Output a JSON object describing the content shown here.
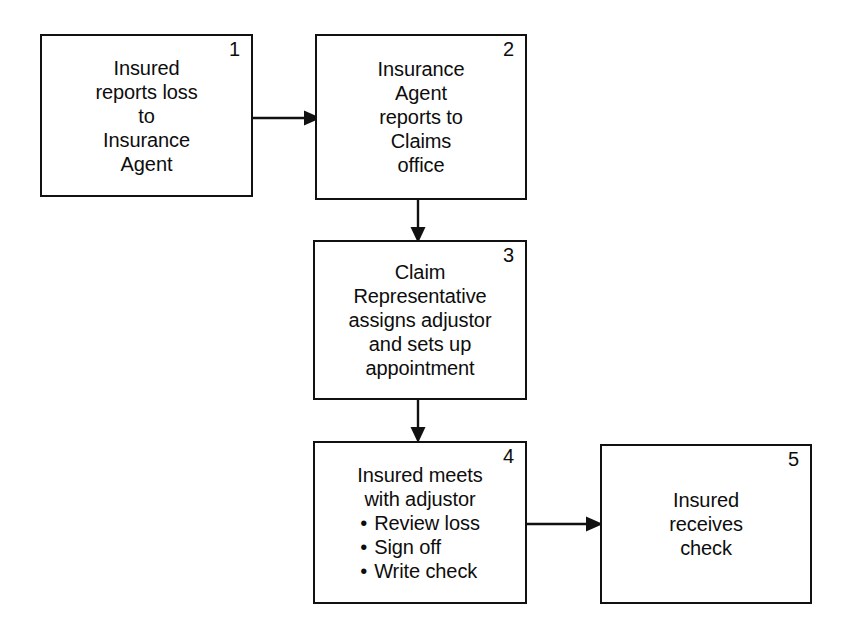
{
  "diagram": {
    "line_color": "#111111",
    "background": "#ffffff",
    "nodes": [
      {
        "id": "node-1",
        "number": "1",
        "name": "insured-reports-loss",
        "lines": [
          "Insured",
          "reports loss",
          "to",
          "Insurance",
          "Agent"
        ]
      },
      {
        "id": "node-2",
        "number": "2",
        "name": "agent-reports-to-claims",
        "lines": [
          "Insurance",
          "Agent",
          "reports to",
          "Claims",
          "office"
        ]
      },
      {
        "id": "node-3",
        "number": "3",
        "name": "claim-rep-assigns-adjustor",
        "lines": [
          "Claim",
          "Representative",
          "assigns adjustor",
          "and sets up",
          "appointment"
        ]
      },
      {
        "id": "node-4",
        "number": "4",
        "name": "insured-meets-adjustor",
        "lines": [
          "Insured meets",
          "with adjustor"
        ],
        "bullets": [
          "Review loss",
          "Sign off",
          "Write check"
        ]
      },
      {
        "id": "node-5",
        "number": "5",
        "name": "insured-receives-check",
        "lines": [
          "Insured",
          "receives",
          "check"
        ]
      }
    ],
    "connectors": [
      {
        "name": "connector-1-to-2",
        "from": "1",
        "to": "2",
        "direction": "right"
      },
      {
        "name": "connector-2-to-3",
        "from": "2",
        "to": "3",
        "direction": "down"
      },
      {
        "name": "connector-3-to-4",
        "from": "3",
        "to": "4",
        "direction": "down"
      },
      {
        "name": "connector-4-to-5",
        "from": "4",
        "to": "5",
        "direction": "right"
      }
    ]
  }
}
